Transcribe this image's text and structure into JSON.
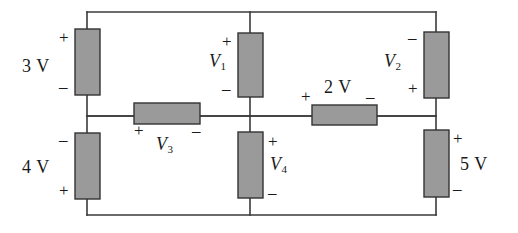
{
  "figure": {
    "kind": "circuit-schematic",
    "colors": {
      "wire": "#3a3a3a",
      "resistor_fill": "#9a9a9a",
      "resistor_stroke": "#333333",
      "background": "#ffffff",
      "text": "#1a1a1a"
    }
  },
  "elements": {
    "source_3v": {
      "label": "3 V",
      "plus": "+",
      "minus": "–",
      "orientation": "vertical",
      "plus_at": "top"
    },
    "source_4v": {
      "label": "4 V",
      "plus": "+",
      "minus": "–",
      "orientation": "vertical",
      "plus_at": "bottom"
    },
    "source_5v": {
      "label": "5 V",
      "plus": "+",
      "minus": "–",
      "orientation": "vertical",
      "plus_at": "top"
    },
    "source_2v": {
      "label": "2 V",
      "plus": "+",
      "minus": "–",
      "orientation": "horizontal",
      "plus_at": "left"
    },
    "element_v1": {
      "label": "V",
      "subscript": "1",
      "plus": "+",
      "minus": "–",
      "orientation": "vertical",
      "plus_at": "top"
    },
    "element_v2": {
      "label": "V",
      "subscript": "2",
      "plus": "+",
      "minus": "–",
      "orientation": "vertical",
      "plus_at": "bottom"
    },
    "element_v3": {
      "label": "V",
      "subscript": "3",
      "plus": "+",
      "minus": "–",
      "orientation": "horizontal",
      "plus_at": "left"
    },
    "element_v4": {
      "label": "V",
      "subscript": "4",
      "plus": "+",
      "minus": "–",
      "orientation": "vertical",
      "plus_at": "top"
    }
  }
}
